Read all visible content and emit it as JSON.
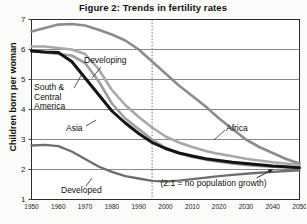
{
  "chart_data": {
    "type": "line",
    "title": "Figure 2: Trends in fertility rates",
    "xlabel": "",
    "ylabel": "Children born per woman",
    "xlim": [
      1950,
      2050
    ],
    "ylim": [
      1,
      7
    ],
    "grid": true,
    "gridlines_y": [
      2,
      3,
      4,
      5,
      6,
      7
    ],
    "xticks": [
      1950,
      1960,
      1970,
      1980,
      1990,
      2000,
      2010,
      2020,
      2030,
      2040,
      2050
    ],
    "yticks": [
      1,
      2,
      3,
      4,
      5,
      6,
      7
    ],
    "legend_position": "inline-labels",
    "annotations": [
      {
        "name": "replacement-level-note",
        "text": "(2.1 = no population growth)",
        "x": 2025,
        "y": 1.55
      },
      {
        "name": "projection-divider",
        "type": "vline",
        "x": 1995,
        "style": "dotted"
      },
      {
        "name": "replacement-arrow",
        "type": "arrow",
        "from": [
          2034,
          1.72
        ],
        "to": [
          2040,
          2.0
        ]
      }
    ],
    "x": [
      1950,
      1955,
      1960,
      1965,
      1970,
      1975,
      1980,
      1985,
      1990,
      1995,
      2000,
      2005,
      2010,
      2015,
      2020,
      2025,
      2030,
      2035,
      2040,
      2045,
      2050
    ],
    "series": [
      {
        "name": "Africa",
        "color": "#8c8c8c",
        "width": 2.6,
        "values": [
          6.6,
          6.72,
          6.83,
          6.85,
          6.8,
          6.66,
          6.5,
          6.3,
          6.0,
          5.6,
          5.2,
          4.8,
          4.45,
          4.1,
          3.7,
          3.35,
          3.0,
          2.75,
          2.55,
          2.35,
          2.2
        ]
      },
      {
        "name": "Developing",
        "color": "#a8a8a8",
        "width": 2.6,
        "values": [
          6.1,
          6.1,
          6.05,
          6.0,
          5.85,
          5.35,
          4.65,
          4.15,
          3.75,
          3.4,
          3.1,
          2.9,
          2.75,
          2.62,
          2.52,
          2.44,
          2.36,
          2.3,
          2.24,
          2.2,
          2.16
        ]
      },
      {
        "name": "Asia",
        "color": "#9e9e9e",
        "width": 2.6,
        "values": [
          5.95,
          5.9,
          5.85,
          5.8,
          5.55,
          4.95,
          4.2,
          3.7,
          3.35,
          3.0,
          2.72,
          2.55,
          2.42,
          2.33,
          2.26,
          2.2,
          2.15,
          2.12,
          2.09,
          2.07,
          2.05
        ]
      },
      {
        "name": "South & Central America",
        "color": "#141414",
        "width": 3.0,
        "values": [
          5.95,
          5.92,
          5.9,
          5.6,
          5.05,
          4.5,
          3.95,
          3.55,
          3.2,
          2.9,
          2.7,
          2.55,
          2.45,
          2.36,
          2.3,
          2.24,
          2.2,
          2.16,
          2.12,
          2.09,
          2.06
        ]
      },
      {
        "name": "Developed",
        "color": "#6e6e6e",
        "width": 2.4,
        "values": [
          2.8,
          2.82,
          2.78,
          2.6,
          2.35,
          2.1,
          1.92,
          1.78,
          1.7,
          1.62,
          1.6,
          1.63,
          1.68,
          1.73,
          1.78,
          1.82,
          1.86,
          1.89,
          1.92,
          1.95,
          1.97
        ]
      }
    ],
    "series_labels": [
      {
        "name": "Developing",
        "text": "Developing",
        "left": 84,
        "top": 56,
        "leader": {
          "x1": 101,
          "y1": 67,
          "x2": 92,
          "y2": 78
        }
      },
      {
        "name": "South & Central America",
        "text": "South &\nCentral\nAmerica",
        "left": 34,
        "top": 83,
        "leader": {
          "x1": 74,
          "y1": 88,
          "x2": 82,
          "y2": 74
        }
      },
      {
        "name": "Asia",
        "text": "Asia",
        "left": 66,
        "top": 124,
        "leader": {
          "x1": 86,
          "y1": 126,
          "x2": 96,
          "y2": 120
        }
      },
      {
        "name": "Africa",
        "text": "Africa",
        "left": 226,
        "top": 124,
        "leader": {
          "x1": 225,
          "y1": 130,
          "x2": 214,
          "y2": 140
        }
      },
      {
        "name": "Developed",
        "text": "Developed",
        "left": 61,
        "top": 186,
        "leader": {
          "x1": 86,
          "y1": 186,
          "x2": 92,
          "y2": 178
        }
      }
    ]
  }
}
